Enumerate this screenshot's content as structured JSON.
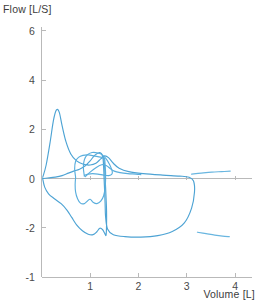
{
  "chart_data": {
    "type": "line",
    "title": "",
    "subtitle": "",
    "xlabel": "Volume [L]",
    "ylabel": "Flow [L/S]",
    "xlim": [
      -0.12,
      4.35
    ],
    "ylim": [
      -4.0,
      6.4
    ],
    "xticks": [
      1,
      2,
      3,
      4
    ],
    "xticklabels": [
      "1",
      "2",
      "3",
      "4"
    ],
    "yticks": [
      6,
      4,
      2,
      0,
      -2,
      -4
    ],
    "yticklabels": [
      "6",
      "4",
      "2",
      "0",
      "-2",
      "-1"
    ],
    "grid": false,
    "legend": null,
    "legend_position": "none",
    "axis_color": "#b9b9b9",
    "series": [
      {
        "name": "flow-volume-loop-1",
        "color": "#4da3d4",
        "description": "main breath loop: sharp inspiratory peak then wide expiratory excursion",
        "points": [
          [
            0.02,
            0.05
          ],
          [
            0.09,
            0.55
          ],
          [
            0.17,
            1.45
          ],
          [
            0.24,
            2.35
          ],
          [
            0.3,
            2.78
          ],
          [
            0.36,
            2.7
          ],
          [
            0.42,
            2.15
          ],
          [
            0.5,
            1.5
          ],
          [
            0.6,
            1.0
          ],
          [
            0.72,
            0.72
          ],
          [
            0.86,
            0.58
          ],
          [
            1.0,
            0.55
          ],
          [
            1.12,
            0.62
          ],
          [
            1.22,
            0.8
          ],
          [
            1.3,
            0.92
          ],
          [
            1.38,
            0.85
          ],
          [
            1.48,
            0.62
          ],
          [
            1.6,
            0.42
          ],
          [
            1.8,
            0.28
          ],
          [
            2.1,
            0.2
          ],
          [
            2.5,
            0.14
          ],
          [
            2.85,
            0.1
          ],
          [
            3.05,
            0.05
          ],
          [
            3.14,
            -0.1
          ],
          [
            3.16,
            -0.55
          ],
          [
            3.1,
            -1.2
          ],
          [
            2.95,
            -1.8
          ],
          [
            2.7,
            -2.15
          ],
          [
            2.4,
            -2.32
          ],
          [
            2.05,
            -2.38
          ],
          [
            1.72,
            -2.36
          ],
          [
            1.48,
            -2.28
          ],
          [
            1.36,
            -2.05
          ],
          [
            1.32,
            -1.55
          ],
          [
            1.31,
            -1.0
          ],
          [
            1.3,
            -0.5
          ],
          [
            1.29,
            -0.05
          ],
          [
            1.28,
            0.45
          ],
          [
            1.26,
            0.9
          ],
          [
            1.2,
            1.05
          ],
          [
            1.1,
            0.95
          ],
          [
            1.0,
            0.72
          ],
          [
            0.9,
            0.52
          ],
          [
            0.78,
            0.38
          ],
          [
            0.66,
            0.3
          ],
          [
            0.55,
            0.22
          ],
          [
            0.42,
            0.12
          ],
          [
            0.28,
            0.06
          ],
          [
            0.12,
            0.02
          ],
          [
            0.02,
            0.0
          ]
        ]
      },
      {
        "name": "flow-volume-loop-2",
        "color": "#4da3d4",
        "description": "lower-left expiratory descent with notched trough",
        "points": [
          [
            0.02,
            -0.02
          ],
          [
            0.06,
            -0.35
          ],
          [
            0.14,
            -0.62
          ],
          [
            0.26,
            -0.82
          ],
          [
            0.4,
            -1.02
          ],
          [
            0.52,
            -1.28
          ],
          [
            0.62,
            -1.58
          ],
          [
            0.72,
            -1.88
          ],
          [
            0.84,
            -2.12
          ],
          [
            0.96,
            -2.26
          ],
          [
            1.06,
            -2.28
          ],
          [
            1.14,
            -2.16
          ],
          [
            1.2,
            -2.02
          ],
          [
            1.26,
            -2.08
          ],
          [
            1.3,
            -2.22
          ],
          [
            1.33,
            -2.3
          ],
          [
            1.34,
            -1.9
          ],
          [
            1.34,
            -1.3
          ],
          [
            1.33,
            -0.8
          ],
          [
            1.32,
            -0.35
          ],
          [
            1.31,
            0.05
          ],
          [
            1.3,
            0.48
          ],
          [
            1.28,
            0.88
          ]
        ]
      },
      {
        "name": "flow-volume-loop-3",
        "color": "#5aaedd",
        "description": "inner tidal loop between 0.6 and 1.35 L",
        "points": [
          [
            0.7,
            0.05
          ],
          [
            0.68,
            0.4
          ],
          [
            0.7,
            0.7
          ],
          [
            0.76,
            0.86
          ],
          [
            0.85,
            0.94
          ],
          [
            0.96,
            0.96
          ],
          [
            1.08,
            0.92
          ],
          [
            1.18,
            0.88
          ],
          [
            1.26,
            0.86
          ],
          [
            1.3,
            0.8
          ],
          [
            1.31,
            0.55
          ],
          [
            1.32,
            0.25
          ],
          [
            1.32,
            -0.05
          ],
          [
            1.31,
            -0.38
          ],
          [
            1.28,
            -0.7
          ],
          [
            1.22,
            -0.92
          ],
          [
            1.14,
            -1.02
          ],
          [
            1.06,
            -0.96
          ],
          [
            1.0,
            -0.84
          ],
          [
            0.94,
            -0.92
          ],
          [
            0.88,
            -1.02
          ],
          [
            0.8,
            -1.0
          ],
          [
            0.74,
            -0.82
          ],
          [
            0.7,
            -0.55
          ],
          [
            0.69,
            -0.25
          ],
          [
            0.7,
            0.05
          ]
        ]
      },
      {
        "name": "flow-volume-loop-4",
        "color": "#5aaedd",
        "description": "narrow inner loop near 0.85-1.4 L with upper bulge",
        "points": [
          [
            0.88,
            0.1
          ],
          [
            0.86,
            0.45
          ],
          [
            0.88,
            0.76
          ],
          [
            0.94,
            0.96
          ],
          [
            1.04,
            1.06
          ],
          [
            1.16,
            1.04
          ],
          [
            1.26,
            0.95
          ],
          [
            1.34,
            0.78
          ],
          [
            1.4,
            0.58
          ],
          [
            1.44,
            0.4
          ],
          [
            1.46,
            0.26
          ],
          [
            1.44,
            0.16
          ],
          [
            1.38,
            0.12
          ],
          [
            1.28,
            0.14
          ],
          [
            1.16,
            0.18
          ],
          [
            1.05,
            0.2
          ],
          [
            0.96,
            0.18
          ],
          [
            0.9,
            0.14
          ],
          [
            0.88,
            0.1
          ]
        ]
      },
      {
        "name": "flow-volume-loop-5",
        "color": "#5aaedd",
        "description": "shallow expiratory shoulder sweeping right to 2.0 L",
        "points": [
          [
            0.9,
            0.08
          ],
          [
            1.0,
            0.26
          ],
          [
            1.12,
            0.44
          ],
          [
            1.24,
            0.56
          ],
          [
            1.34,
            0.52
          ],
          [
            1.42,
            0.4
          ],
          [
            1.5,
            0.3
          ],
          [
            1.62,
            0.24
          ],
          [
            1.78,
            0.2
          ],
          [
            1.95,
            0.18
          ],
          [
            2.05,
            0.16
          ]
        ]
      },
      {
        "name": "flow-volume-loop-6",
        "color": "#69b6e0",
        "description": "short right-side segment near -2.2 L/S beyond 3.2 L",
        "points": [
          [
            3.22,
            -2.18
          ],
          [
            3.4,
            -2.24
          ],
          [
            3.58,
            -2.3
          ],
          [
            3.74,
            -2.34
          ],
          [
            3.88,
            -2.36
          ]
        ]
      },
      {
        "name": "flow-volume-loop-7",
        "color": "#69b6e0",
        "description": "faint upper-right segment just above zero past 3.1 L",
        "points": [
          [
            3.1,
            0.18
          ],
          [
            3.3,
            0.22
          ],
          [
            3.52,
            0.26
          ],
          [
            3.72,
            0.28
          ],
          [
            3.9,
            0.3
          ]
        ]
      }
    ]
  }
}
